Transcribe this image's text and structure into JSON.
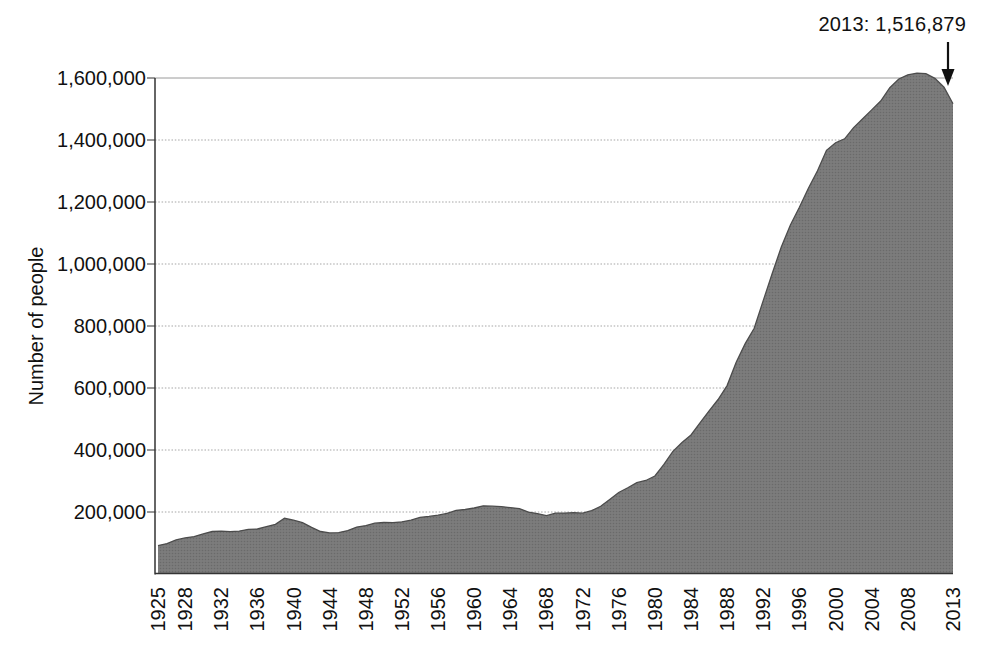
{
  "chart_data": {
    "type": "area",
    "title": "",
    "xlabel": "",
    "ylabel": "Number of people",
    "ylim": [
      0,
      1600000
    ],
    "xlim": [
      1925,
      2013
    ],
    "grid": true,
    "legend": "none",
    "annotation": {
      "text": "2013: 1,516,879",
      "x": 2013,
      "y": 1516879
    },
    "y_ticks": [
      {
        "value": 200000,
        "label": "200,000"
      },
      {
        "value": 400000,
        "label": "400,000"
      },
      {
        "value": 600000,
        "label": "600,000"
      },
      {
        "value": 800000,
        "label": "800,000"
      },
      {
        "value": 1000000,
        "label": "1,000,000"
      },
      {
        "value": 1200000,
        "label": "1,200,000"
      },
      {
        "value": 1400000,
        "label": "1,400,000"
      },
      {
        "value": 1600000,
        "label": "1,600,000"
      }
    ],
    "x_ticks": [
      "1925",
      "1928",
      "1932",
      "1936",
      "1940",
      "1944",
      "1948",
      "1952",
      "1956",
      "1960",
      "1964",
      "1968",
      "1972",
      "1976",
      "1980",
      "1984",
      "1988",
      "1992",
      "1996",
      "2000",
      "2004",
      "2008",
      "2013"
    ],
    "series": [
      {
        "name": "Number of people",
        "points": [
          [
            1925,
            91669
          ],
          [
            1926,
            97991
          ],
          [
            1927,
            109983
          ],
          [
            1928,
            116390
          ],
          [
            1929,
            120496
          ],
          [
            1930,
            129453
          ],
          [
            1931,
            137082
          ],
          [
            1932,
            137997
          ],
          [
            1933,
            136810
          ],
          [
            1934,
            138316
          ],
          [
            1935,
            144180
          ],
          [
            1936,
            145038
          ],
          [
            1937,
            152741
          ],
          [
            1938,
            160285
          ],
          [
            1939,
            179818
          ],
          [
            1940,
            173706
          ],
          [
            1941,
            165439
          ],
          [
            1942,
            150384
          ],
          [
            1943,
            137220
          ],
          [
            1944,
            132456
          ],
          [
            1945,
            133649
          ],
          [
            1946,
            140079
          ],
          [
            1947,
            151304
          ],
          [
            1948,
            155977
          ],
          [
            1949,
            163749
          ],
          [
            1950,
            166123
          ],
          [
            1951,
            165680
          ],
          [
            1952,
            168233
          ],
          [
            1953,
            173579
          ],
          [
            1954,
            182901
          ],
          [
            1955,
            185780
          ],
          [
            1956,
            189565
          ],
          [
            1957,
            195414
          ],
          [
            1958,
            205643
          ],
          [
            1959,
            208105
          ],
          [
            1960,
            212953
          ],
          [
            1961,
            220149
          ],
          [
            1962,
            218830
          ],
          [
            1963,
            217283
          ],
          [
            1964,
            214336
          ],
          [
            1965,
            210895
          ],
          [
            1966,
            199654
          ],
          [
            1967,
            194896
          ],
          [
            1968,
            187914
          ],
          [
            1969,
            196007
          ],
          [
            1970,
            196429
          ],
          [
            1971,
            198061
          ],
          [
            1972,
            196092
          ],
          [
            1973,
            204211
          ],
          [
            1974,
            218466
          ],
          [
            1975,
            240593
          ],
          [
            1976,
            262833
          ],
          [
            1977,
            278141
          ],
          [
            1978,
            294396
          ],
          [
            1979,
            301470
          ],
          [
            1980,
            315974
          ],
          [
            1981,
            353673
          ],
          [
            1982,
            395516
          ],
          [
            1983,
            423898
          ],
          [
            1984,
            448264
          ],
          [
            1985,
            487593
          ],
          [
            1986,
            526436
          ],
          [
            1987,
            562814
          ],
          [
            1988,
            607766
          ],
          [
            1989,
            683382
          ],
          [
            1990,
            743382
          ],
          [
            1991,
            792535
          ],
          [
            1992,
            882500
          ],
          [
            1993,
            970444
          ],
          [
            1994,
            1054774
          ],
          [
            1995,
            1125874
          ],
          [
            1996,
            1183368
          ],
          [
            1997,
            1244554
          ],
          [
            1998,
            1300573
          ],
          [
            1999,
            1366721
          ],
          [
            2000,
            1391261
          ],
          [
            2001,
            1404032
          ],
          [
            2002,
            1440144
          ],
          [
            2003,
            1468601
          ],
          [
            2004,
            1497100
          ],
          [
            2005,
            1525910
          ],
          [
            2006,
            1568674
          ],
          [
            2007,
            1596835
          ],
          [
            2008,
            1610446
          ],
          [
            2009,
            1615487
          ],
          [
            2010,
            1613803
          ],
          [
            2011,
            1598783
          ],
          [
            2012,
            1570397
          ],
          [
            2013,
            1516879
          ]
        ]
      }
    ],
    "colors": {
      "fill": "#7c7c7c",
      "fill_dot": "#6a6a6a",
      "outline": "#4c4c4c",
      "grid": "#909090",
      "axis": "#333333",
      "text": "#111111",
      "arrow": "#111111",
      "background": "#ffffff"
    }
  }
}
